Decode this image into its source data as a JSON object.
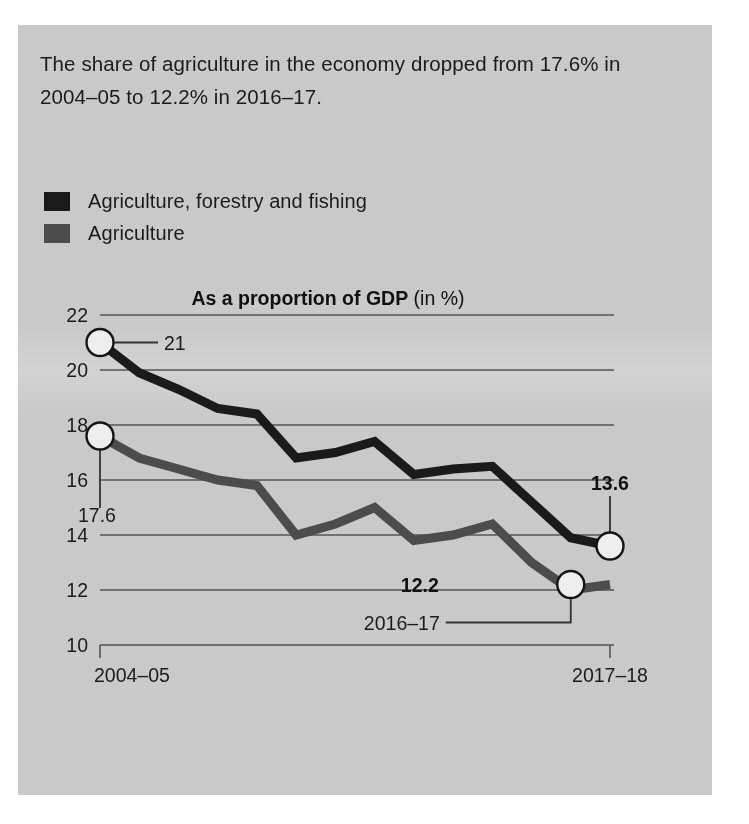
{
  "panel": {
    "background_color": "#cdcdcd",
    "headline": "The share of agriculture in the economy dropped from 17.6% in 2004–05 to 12.2% in 2016–17."
  },
  "legend": {
    "items": [
      {
        "label": "Agriculture, forestry and fishing",
        "color": "#1a1a1a"
      },
      {
        "label": "Agriculture",
        "color": "#4d4d4d"
      }
    ]
  },
  "chart_data": {
    "type": "line",
    "title": "As a proportion of GDP",
    "title_suffix": "(in %)",
    "xlabel": "",
    "ylabel": "",
    "ylim": [
      10,
      22
    ],
    "yticks": [
      22,
      20,
      18,
      16,
      14,
      12,
      10
    ],
    "ytick_labels": [
      "22",
      "20",
      "18",
      "16",
      "14",
      "12",
      "10"
    ],
    "grid": true,
    "legend_position": "above-plot",
    "x": [
      "2004–05",
      "2005–06",
      "2006–07",
      "2007–08",
      "2008–09",
      "2009–10",
      "2010–11",
      "2011–12",
      "2012–13",
      "2013–14",
      "2014–15",
      "2015–16",
      "2016–17",
      "2017–18"
    ],
    "xtick_labels": [
      "2004–05",
      "2017–18"
    ],
    "series": [
      {
        "name": "Agriculture, forestry and fishing",
        "color": "#1a1a1a",
        "values": [
          21.0,
          19.9,
          19.3,
          18.6,
          18.4,
          16.8,
          17.0,
          17.4,
          16.2,
          16.4,
          16.5,
          15.2,
          13.9,
          13.6
        ]
      },
      {
        "name": "Agriculture",
        "color": "#4d4d4d",
        "values": [
          17.6,
          16.8,
          16.4,
          16.0,
          15.8,
          14.0,
          14.4,
          15.0,
          13.8,
          14.0,
          14.4,
          13.0,
          12.0,
          12.2
        ]
      }
    ],
    "annotations": [
      {
        "text": "21",
        "series": "Agriculture, forestry and fishing",
        "x": "2004–05",
        "value": 21.0,
        "bold": false
      },
      {
        "text": "17.6",
        "series": "Agriculture",
        "x": "2004–05",
        "value": 17.6,
        "bold": false
      },
      {
        "text": "13.6",
        "series": "Agriculture, forestry and fishing",
        "x": "2017–18",
        "value": 13.6,
        "bold": true
      },
      {
        "text": "12.2",
        "series": "Agriculture",
        "x": "2016–17",
        "value": 12.2,
        "bold": true
      },
      {
        "text": "2016–17",
        "series": "Agriculture",
        "x": "2016–17",
        "value": 12.2,
        "bold": false
      }
    ],
    "markers": [
      {
        "series": "Agriculture, forestry and fishing",
        "x": "2004–05",
        "value": 21.0
      },
      {
        "series": "Agriculture",
        "x": "2004–05",
        "value": 17.6
      },
      {
        "series": "Agriculture, forestry and fishing",
        "x": "2017–18",
        "value": 13.6
      },
      {
        "series": "Agriculture",
        "x": "2016–17",
        "value": 12.2
      }
    ]
  }
}
